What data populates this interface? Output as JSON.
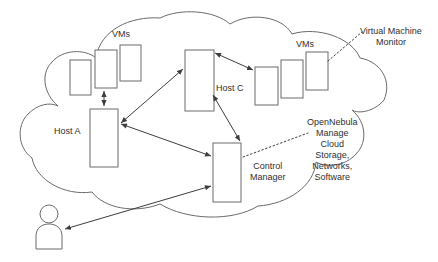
{
  "diagram": {
    "style": {
      "background_color": "#ffffff",
      "box_stroke_color": "#6b6b6b",
      "cloud_stroke_color": "#6b6b6b",
      "connector_color": "#3d3d3d",
      "text_color": "#2f2f2f"
    },
    "labels": {
      "vms_left": "VMs",
      "vms_right": "VMs",
      "host_a": "Host A",
      "host_c": "Host C",
      "control_manager": "Control\nManager",
      "virtual_machine_monitor": "Virtual Machine\nMonitor",
      "opennebula": "OpenNebula\nManage\nCloud\nStorage,\nNetworks,\nSoftware"
    },
    "nodes": [
      {
        "id": "vm-left-1",
        "label": "",
        "group": "vms_left"
      },
      {
        "id": "vm-left-2",
        "label": "",
        "group": "vms_left"
      },
      {
        "id": "vm-left-3",
        "label": "",
        "group": "vms_left"
      },
      {
        "id": "host-a",
        "label": "Host A",
        "group": "host"
      },
      {
        "id": "host-c",
        "label": "Host C",
        "group": "host"
      },
      {
        "id": "vm-right-1",
        "label": "",
        "group": "vms_right"
      },
      {
        "id": "vm-right-2",
        "label": "",
        "group": "vms_right"
      },
      {
        "id": "vm-right-3",
        "label": "",
        "group": "vms_right"
      },
      {
        "id": "control-manager",
        "label": "Control Manager",
        "group": "control"
      },
      {
        "id": "user",
        "label": "",
        "group": "actor"
      }
    ],
    "connections": [
      {
        "from": "host-a",
        "to": "vm-left-2",
        "style": "solid",
        "arrows": "both"
      },
      {
        "from": "host-a",
        "to": "host-c",
        "style": "solid",
        "arrows": "both"
      },
      {
        "from": "host-a",
        "to": "control-manager",
        "style": "solid",
        "arrows": "both"
      },
      {
        "from": "host-c",
        "to": "vm-right-1",
        "style": "solid",
        "arrows": "both"
      },
      {
        "from": "host-c",
        "to": "control-manager",
        "style": "solid",
        "arrows": "both"
      },
      {
        "from": "control-manager",
        "to": "user",
        "style": "solid",
        "arrows": "both"
      },
      {
        "from": "virtual-machine-monitor-label",
        "to": "vm-right-3",
        "style": "dotted",
        "arrows": "none"
      },
      {
        "from": "opennebula-label",
        "to": "control-manager",
        "style": "dotted",
        "arrows": "none"
      }
    ]
  }
}
